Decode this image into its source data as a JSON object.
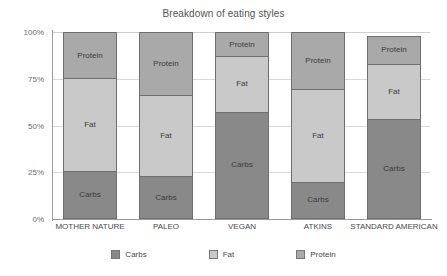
{
  "chart_data": {
    "type": "bar",
    "stacked": true,
    "title": "Breakdown of eating styles",
    "xlabel": "",
    "ylabel": "",
    "ylim": [
      0,
      100
    ],
    "grid": true,
    "legend_position": "bottom",
    "categories": [
      "MOTHER NATURE",
      "PALEO",
      "VEGAN",
      "ATKINS",
      "STANDARD AMERICAN"
    ],
    "ytick_labels": [
      "0%",
      "25%",
      "50%",
      "75%",
      "100%"
    ],
    "ytick_values": [
      0,
      25,
      50,
      75,
      100
    ],
    "series": [
      {
        "name": "Carbs",
        "color": "#898989",
        "values": [
          25,
          22,
          57,
          19,
          53
        ]
      },
      {
        "name": "Fat",
        "color": "#c9c9c9",
        "values": [
          50,
          44,
          30,
          50,
          30
        ]
      },
      {
        "name": "Protein",
        "color": "#a9a9a9",
        "values": [
          25,
          34,
          13,
          31,
          15
        ]
      }
    ],
    "bar_totals": [
      100,
      100,
      100,
      100,
      98
    ],
    "segment_labels": {
      "carbs": "Carbs",
      "fat": "Fat",
      "protein": "Protein"
    }
  },
  "legend": {
    "items": [
      {
        "label": "Carbs",
        "color": "#898989"
      },
      {
        "label": "Fat",
        "color": "#c9c9c9"
      },
      {
        "label": "Protein",
        "color": "#a9a9a9"
      }
    ]
  }
}
